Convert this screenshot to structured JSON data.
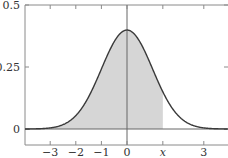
{
  "chart_data": {
    "type": "area",
    "title": "",
    "xlabel": "",
    "ylabel": "",
    "function": "standard_normal_pdf",
    "mean": 0,
    "std": 1,
    "xlim": [
      -4,
      4
    ],
    "ylim": [
      0,
      0.5
    ],
    "peak_value": 0.3989,
    "shaded_region": {
      "from": -4,
      "to": 1.4,
      "label": "x"
    },
    "x_ticks": [
      {
        "value": -3,
        "label": "−3"
      },
      {
        "value": -2,
        "label": "−2"
      },
      {
        "value": -1,
        "label": "−1"
      },
      {
        "value": 0,
        "label": "0"
      },
      {
        "value": 1.4,
        "label": "x"
      },
      {
        "value": 3,
        "label": "3"
      }
    ],
    "y_ticks": [
      {
        "value": 0,
        "label": "0"
      },
      {
        "value": 0.25,
        "label": "0.25"
      },
      {
        "value": 0.5,
        "label": "0.5"
      }
    ],
    "grid": false,
    "legend": "none",
    "colors": {
      "curve": "#3a3a3a",
      "shade": "#d6d6d6",
      "axis": "#666666",
      "frame": "#8a8a8a"
    }
  }
}
